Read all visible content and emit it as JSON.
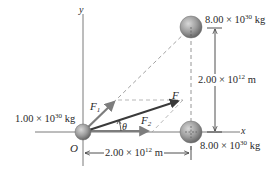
{
  "diagram": {
    "axes": {
      "x_label": "x",
      "y_label": "y",
      "origin_label": "O"
    },
    "masses": [
      {
        "id": "origin",
        "mantissa": "1.00",
        "times": "×",
        "base": "10",
        "exp": "30",
        "unit": "kg"
      },
      {
        "id": "top",
        "mantissa": "8.00",
        "times": "×",
        "base": "10",
        "exp": "30",
        "unit": "kg"
      },
      {
        "id": "bottom",
        "mantissa": "8.00",
        "times": "×",
        "base": "10",
        "exp": "30",
        "unit": "kg"
      }
    ],
    "dimensions": {
      "vertical": {
        "mantissa": "2.00",
        "times": "×",
        "base": "10",
        "exp": "12",
        "unit": "m"
      },
      "horizontal": {
        "mantissa": "2.00",
        "times": "×",
        "base": "10",
        "exp": "12",
        "unit": "m"
      }
    },
    "forces": {
      "f1": {
        "symbol": "F",
        "sub": "1"
      },
      "f2": {
        "symbol": "F",
        "sub": "2"
      },
      "net": {
        "symbol": "F"
      }
    },
    "angle": {
      "symbol": "θ"
    },
    "colors": {
      "axis": "#6b6b6b",
      "force_vector": "#7d7d7d",
      "net_force": "#3a3a3a",
      "dashed": "#8a8a8a",
      "ball": "#9a9a9a",
      "text": "#2a2a2a"
    }
  }
}
